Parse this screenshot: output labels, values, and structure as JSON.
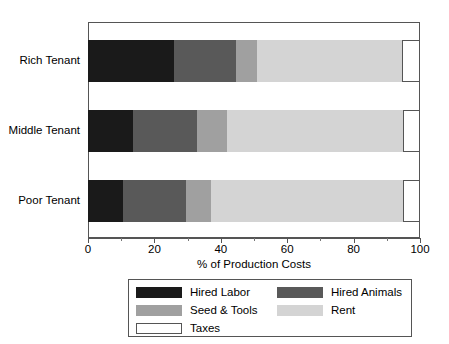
{
  "chart_data": {
    "type": "bar",
    "orientation": "horizontal",
    "stacked": true,
    "title": "",
    "xlabel": "% of Production Costs",
    "ylabel": "",
    "xlim": [
      0,
      100
    ],
    "xticks": [
      0,
      20,
      40,
      60,
      80,
      100
    ],
    "xtick_labels": [
      "0",
      "20",
      "40",
      "60",
      "80",
      "100"
    ],
    "grid": false,
    "legend_position": "bottom",
    "categories": [
      "Rich Tenant",
      "Middle Tenant",
      "Poor Tenant"
    ],
    "series": [
      {
        "name": "Hired Labor",
        "color": "#1a1a1a",
        "values": [
          26.0,
          13.5,
          10.5
        ]
      },
      {
        "name": "Hired Animals",
        "color": "#595959",
        "values": [
          18.5,
          19.3,
          19.0
        ]
      },
      {
        "name": "Seed & Tools",
        "color": "#a0a0a0",
        "values": [
          6.5,
          9.0,
          7.5
        ]
      },
      {
        "name": "Rent",
        "color": "#d4d4d4",
        "values": [
          43.5,
          53.0,
          58.0
        ]
      },
      {
        "name": "Taxes",
        "color": "#ffffff",
        "values": [
          5.5,
          5.2,
          5.0
        ]
      }
    ]
  },
  "axis": {
    "x_title": "% of Production Costs",
    "tick_0": "0",
    "tick_20": "20",
    "tick_40": "40",
    "tick_60": "60",
    "tick_80": "80",
    "tick_100": "100"
  },
  "categories": {
    "rich": "Rich Tenant",
    "middle": "Middle Tenant",
    "poor": "Poor Tenant"
  },
  "legend": {
    "hired_labor": "Hired Labor",
    "hired_animals": "Hired Animals",
    "seed_tools": "Seed & Tools",
    "rent": "Rent",
    "taxes": "Taxes"
  },
  "colors": {
    "hired_labor": "#1a1a1a",
    "hired_animals": "#595959",
    "seed_tools": "#a0a0a0",
    "rent": "#d4d4d4",
    "taxes": "#ffffff",
    "frame": "#555555"
  }
}
